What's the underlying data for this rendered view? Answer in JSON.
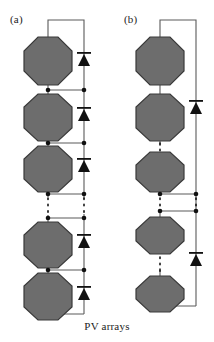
{
  "figure": {
    "caption": "PV arrays",
    "panels": [
      {
        "id": "a",
        "label": "(a)",
        "topology": "series-string-with-per-module-bypass-diodes",
        "module_count_visible": 5,
        "modules": [
          {
            "index": 1,
            "shape": "octagon",
            "cx": 48,
            "cy": 61,
            "r": 24
          },
          {
            "index": 2,
            "shape": "octagon",
            "cx": 48,
            "cy": 117,
            "r": 24
          },
          {
            "index": 3,
            "shape": "octagon",
            "cx": 48,
            "cy": 168,
            "r": 24
          },
          {
            "index": 4,
            "shape": "octagon",
            "cx": 48,
            "cy": 244,
            "r": 24
          },
          {
            "index": 5,
            "shape": "octagon",
            "cx": 48,
            "cy": 296,
            "r": 24
          }
        ],
        "diodes": [
          {
            "index": 1,
            "x": 84,
            "cy": 62,
            "orientation": "up"
          },
          {
            "index": 2,
            "x": 84,
            "cy": 117,
            "orientation": "up"
          },
          {
            "index": 3,
            "x": 84,
            "cy": 168,
            "orientation": "up"
          },
          {
            "index": 4,
            "x": 84,
            "cy": 244,
            "orientation": "up"
          },
          {
            "index": 5,
            "x": 84,
            "cy": 296,
            "orientation": "up"
          }
        ],
        "nodes": [
          {
            "x": 48,
            "y": 90
          },
          {
            "x": 84,
            "y": 90
          },
          {
            "x": 48,
            "y": 143
          },
          {
            "x": 84,
            "y": 143
          },
          {
            "x": 48,
            "y": 194
          },
          {
            "x": 84,
            "y": 194
          },
          {
            "x": 48,
            "y": 218
          },
          {
            "x": 84,
            "y": 218
          },
          {
            "x": 48,
            "y": 270
          },
          {
            "x": 84,
            "y": 270
          }
        ],
        "ellipsis": [
          {
            "x": 48,
            "y_from": 196,
            "y_to": 216
          },
          {
            "x": 84,
            "y_from": 196,
            "y_to": 216
          }
        ]
      },
      {
        "id": "b",
        "label": "(b)",
        "topology": "series-string-with-single-blocking-diode",
        "module_count_visible": 5,
        "modules": [
          {
            "index": 1,
            "shape": "octagon",
            "cx": 160,
            "cy": 61,
            "r": 24
          },
          {
            "index": 2,
            "shape": "octagon",
            "cx": 160,
            "cy": 117,
            "r": 24
          },
          {
            "index": 3,
            "shape": "octagon",
            "cx": 160,
            "cy": 168,
            "r": 24
          },
          {
            "index": 4,
            "shape": "octagon",
            "cx": 160,
            "cy": 229,
            "r": 24
          },
          {
            "index": 5,
            "shape": "octagon",
            "cx": 160,
            "cy": 288,
            "r": 24
          }
        ],
        "diodes": [
          {
            "index": 1,
            "x": 196,
            "cy": 110,
            "orientation": "up"
          },
          {
            "index": 2,
            "x": 196,
            "cy": 262,
            "orientation": "up"
          }
        ],
        "nodes": [
          {
            "x": 160,
            "y": 194
          },
          {
            "x": 196,
            "y": 194
          },
          {
            "x": 160,
            "y": 211
          },
          {
            "x": 196,
            "y": 211
          }
        ],
        "ellipsis": [
          {
            "x": 160,
            "y_from": 143,
            "y_to": 152
          },
          {
            "x": 160,
            "y_from": 198,
            "y_to": 208
          },
          {
            "x": 196,
            "y_from": 198,
            "y_to": 208
          },
          {
            "x": 160,
            "y_from": 256,
            "y_to": 266
          }
        ]
      }
    ]
  },
  "colors": {
    "module_fill": "#6d6d6d",
    "module_stroke": "#3a3a3a",
    "wire": "#5a5a5a",
    "node": "#111111",
    "diode": "#111111",
    "text": "#1c1c1c",
    "background": "#ffffff"
  }
}
